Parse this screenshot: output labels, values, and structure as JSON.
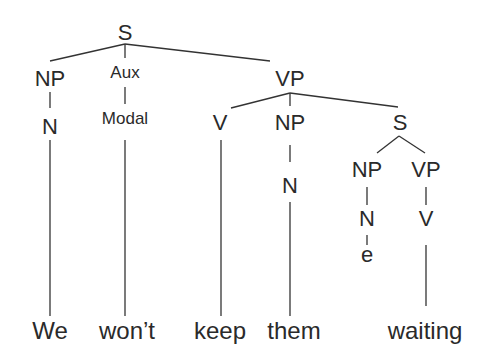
{
  "diagram": {
    "type": "syntax-tree",
    "sentence": "We won't keep them waiting",
    "nodes": {
      "root_s": "S",
      "np1": "NP",
      "aux": "Aux",
      "vp1": "VP",
      "n1": "N",
      "modal": "Modal",
      "v1": "V",
      "np2": "NP",
      "s2": "S",
      "n2": "N",
      "np3": "NP",
      "vp2": "VP",
      "n3": "N",
      "v2": "V",
      "e": "e"
    },
    "words": {
      "w1": "We",
      "w2": "won’t",
      "w3": "keep",
      "w4": "them",
      "w5": "waiting"
    }
  }
}
